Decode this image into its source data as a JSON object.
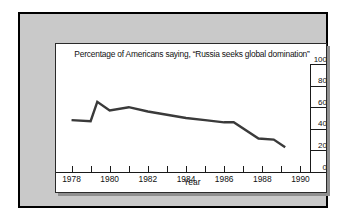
{
  "chart_data": {
    "type": "line",
    "title": "Percentage of Americans saying, “Russia seeks global domination”",
    "xlabel": "Year",
    "ylabel": "",
    "xlim": [
      1977.5,
      1990.5
    ],
    "ylim": [
      0,
      100
    ],
    "grid": false,
    "legend": "none",
    "yticks": [
      100,
      80,
      60,
      40,
      20,
      0
    ],
    "ytick_labels": [
      "100",
      "80",
      "60",
      "40",
      "20",
      "0"
    ],
    "xticks": [
      1978,
      1979,
      1980,
      1981,
      1982,
      1983,
      1984,
      1985,
      1986,
      1987,
      1988,
      1989,
      1990
    ],
    "xtick_labels": [
      "1978",
      "1980",
      "1982",
      "1984",
      "1986",
      "1988",
      "1990"
    ],
    "xtick_label_values": [
      1978,
      1980,
      1982,
      1984,
      1986,
      1988,
      1990
    ],
    "line_color": "#3a3a3a",
    "x": [
      1978,
      1979,
      1979.35,
      1980,
      1981,
      1982,
      1983,
      1984,
      1985,
      1986,
      1986.5,
      1987.8,
      1988.6,
      1989.2
    ],
    "values": [
      48,
      47,
      65,
      57,
      60,
      56,
      53,
      50,
      48,
      46,
      46,
      31,
      30,
      23
    ],
    "series": [
      {
        "name": "Russia seeks global domination",
        "x": [
          1978,
          1979,
          1979.35,
          1980,
          1981,
          1982,
          1983,
          1984,
          1985,
          1986,
          1986.5,
          1987.8,
          1988.6,
          1989.2
        ],
        "values": [
          48,
          47,
          65,
          57,
          60,
          56,
          53,
          50,
          48,
          46,
          46,
          31,
          30,
          23
        ]
      }
    ]
  },
  "colors": {
    "outer_border": "#000000",
    "mat": "#c9c9c9",
    "panel": "#ffffff",
    "ink": "#111111",
    "line": "#3a3a3a",
    "shadow": "#8f8f8f"
  }
}
